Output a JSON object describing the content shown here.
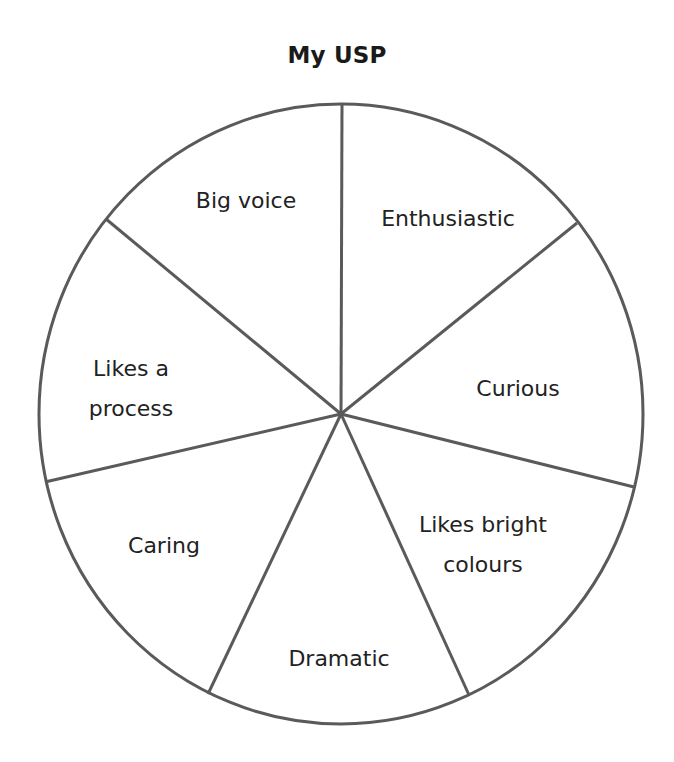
{
  "title": "My USP",
  "wheel": {
    "segments": [
      {
        "label_lines": [
          "Big voice"
        ]
      },
      {
        "label_lines": [
          "Enthusiastic"
        ]
      },
      {
        "label_lines": [
          "Curious"
        ]
      },
      {
        "label_lines": [
          "Likes bright",
          "colours"
        ]
      },
      {
        "label_lines": [
          "Dramatic"
        ]
      },
      {
        "label_lines": [
          "Caring"
        ]
      },
      {
        "label_lines": [
          "Likes a",
          "process"
        ]
      }
    ],
    "line_color": "#5a5a5a",
    "text_color": "#222222"
  }
}
